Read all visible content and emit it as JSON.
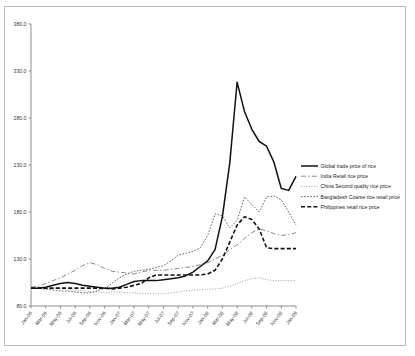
{
  "chart_data": {
    "type": "line",
    "title": "",
    "xlabel": "",
    "ylabel": "",
    "ylim": [
      80.0,
      380.0
    ],
    "yticks": [
      "80.0",
      "130.0",
      "180.0",
      "230.0",
      "280.0",
      "330.0",
      "380.0"
    ],
    "ytick_values": [
      80,
      130,
      180,
      230,
      280,
      330,
      380
    ],
    "grid": false,
    "legend_position": "right",
    "categories": [
      "Jan-06",
      "Feb-06",
      "Mar-06",
      "Apr-06",
      "May-06",
      "Jun-06",
      "Jul-06",
      "Aug-06",
      "Sep-06",
      "Oct-06",
      "Nov-06",
      "Dec-06",
      "Jan-07",
      "Feb-07",
      "Mar-07",
      "Apr-07",
      "May-07",
      "Jun-07",
      "Jul-07",
      "Aug-07",
      "Sep-07",
      "Oct-07",
      "Nov-07",
      "Dec-07",
      "Jan-08",
      "Feb-08",
      "Mar-08",
      "Apr-08",
      "May-08",
      "Jun-08",
      "Jul-08",
      "Aug-08",
      "Sep-08",
      "Oct-08",
      "Nov-08",
      "Dec-08",
      "Jan-09"
    ],
    "xtick_labels": [
      "Jan-06",
      "Mar-06",
      "May-06",
      "Jul-06",
      "Sep-06",
      "Nov-06",
      "Jan-07",
      "Mar-07",
      "May-07",
      "Jul-07",
      "Sep-07",
      "Nov-07",
      "Jan-08",
      "Mar-08",
      "May-08",
      "Jul-08",
      "Sep-08",
      "Nov-08",
      "Jan-09"
    ],
    "series": [
      {
        "name": "Global trade price of rice",
        "style": "solid",
        "color": "#111111",
        "values": [
          99,
          99,
          100,
          102,
          104,
          105,
          104,
          102,
          101,
          100,
          99,
          99,
          100,
          103,
          106,
          107,
          107,
          107,
          108,
          109,
          110,
          112,
          116,
          122,
          128,
          140,
          175,
          232,
          318,
          287,
          268,
          255,
          250,
          233,
          205,
          203,
          218
        ]
      },
      {
        "name": "India Retail rice price",
        "style": "dash-dot",
        "color": "#8a8a8a",
        "values": [
          100,
          101,
          104,
          107,
          110,
          114,
          118,
          123,
          126,
          124,
          120,
          117,
          116,
          115,
          114,
          116,
          118,
          118,
          118,
          119,
          120,
          121,
          122,
          124,
          126,
          130,
          134,
          140,
          145,
          152,
          158,
          162,
          160,
          157,
          155,
          156,
          158
        ]
      },
      {
        "name": "China Second quality rice price",
        "style": "dotted",
        "color": "#9a9a9a",
        "values": [
          99,
          99,
          99,
          99,
          99,
          98,
          97,
          96,
          95,
          95,
          94,
          95,
          95,
          94,
          94,
          93,
          93,
          93,
          93,
          94,
          95,
          96,
          97,
          97,
          98,
          98,
          99,
          101,
          104,
          107,
          109,
          110,
          108,
          107,
          107,
          107,
          107
        ]
      },
      {
        "name": "Bangladesh Coarse rice retail price",
        "style": "fine-dotted",
        "color": "#6d6d6d",
        "values": [
          99,
          99,
          98,
          97,
          96,
          96,
          95,
          94,
          94,
          96,
          99,
          104,
          110,
          114,
          117,
          118,
          119,
          121,
          123,
          128,
          134,
          136,
          138,
          142,
          155,
          178,
          176,
          163,
          171,
          196,
          188,
          180,
          196,
          197,
          193,
          180,
          166
        ]
      },
      {
        "name": "Philippines retail rice price",
        "style": "dashed",
        "color": "#111111",
        "values": [
          99,
          99,
          99,
          99,
          99,
          99,
          99,
          99,
          99,
          99,
          99,
          98,
          99,
          100,
          102,
          104,
          110,
          113,
          113,
          113,
          113,
          113,
          113,
          113,
          114,
          118,
          130,
          148,
          166,
          175,
          172,
          162,
          142,
          141,
          141,
          141,
          141
        ]
      }
    ]
  },
  "legend": {
    "items": [
      {
        "label": "Global trade price of rice"
      },
      {
        "label": "India Retail rice price"
      },
      {
        "label": "China Second quality rice price"
      },
      {
        "label": "Bangladesh Coarse rice retail price"
      },
      {
        "label": "Philippines retail rice price"
      }
    ]
  }
}
